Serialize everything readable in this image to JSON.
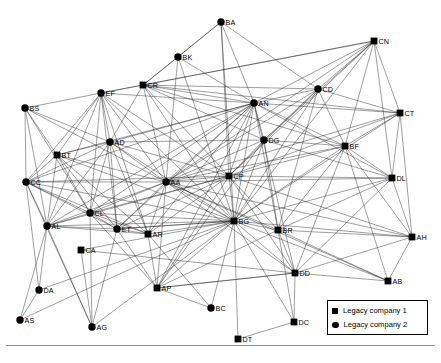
{
  "figure": {
    "type": "network-graph",
    "title": "",
    "background": "#ffffff",
    "edge_color": "#1a1a1a",
    "node_color": "#000000"
  },
  "legend": {
    "position": "bottom-right",
    "items": [
      {
        "marker": "square",
        "label": "Legacy company 1"
      },
      {
        "marker": "circle",
        "label": "Legacy company 2"
      }
    ]
  },
  "chart_data": {
    "type": "scatter",
    "title": "",
    "xlabel": "",
    "ylabel": "",
    "nodes": [
      {
        "id": "BA",
        "label": "BA",
        "x": 221,
        "y": 22,
        "shape": "circle"
      },
      {
        "id": "CN",
        "label": "CN",
        "x": 374,
        "y": 41,
        "shape": "square"
      },
      {
        "id": "BK",
        "label": "BK",
        "x": 178,
        "y": 57,
        "shape": "circle"
      },
      {
        "id": "CR",
        "label": "CR",
        "x": 143,
        "y": 85,
        "shape": "square"
      },
      {
        "id": "CD",
        "label": "CD",
        "x": 318,
        "y": 89,
        "shape": "circle"
      },
      {
        "id": "EF",
        "label": "EF",
        "x": 101,
        "y": 93,
        "shape": "circle"
      },
      {
        "id": "AN",
        "label": "AN",
        "x": 254,
        "y": 103,
        "shape": "circle"
      },
      {
        "id": "BS",
        "label": "BS",
        "x": 25,
        "y": 108,
        "shape": "circle"
      },
      {
        "id": "CT",
        "label": "CT",
        "x": 400,
        "y": 113,
        "shape": "square"
      },
      {
        "id": "DG",
        "label": "DG",
        "x": 264,
        "y": 140,
        "shape": "circle"
      },
      {
        "id": "AD",
        "label": "AD",
        "x": 110,
        "y": 142,
        "shape": "circle"
      },
      {
        "id": "BF",
        "label": "BF",
        "x": 345,
        "y": 146,
        "shape": "square"
      },
      {
        "id": "BT",
        "label": "BT",
        "x": 57,
        "y": 155,
        "shape": "square"
      },
      {
        "id": "DL",
        "label": "DL",
        "x": 392,
        "y": 178,
        "shape": "square"
      },
      {
        "id": "AA",
        "label": "AA",
        "x": 166,
        "y": 182,
        "shape": "circle"
      },
      {
        "id": "CP",
        "label": "CP",
        "x": 229,
        "y": 176,
        "shape": "square"
      },
      {
        "id": "CC",
        "label": "CC",
        "x": 26,
        "y": 182,
        "shape": "circle"
      },
      {
        "id": "CL",
        "label": "CL",
        "x": 90,
        "y": 213,
        "shape": "circle"
      },
      {
        "id": "BG",
        "label": "BG",
        "x": 234,
        "y": 221,
        "shape": "square"
      },
      {
        "id": "AL",
        "label": "AL",
        "x": 47,
        "y": 226,
        "shape": "circle"
      },
      {
        "id": "ET",
        "label": "ET",
        "x": 117,
        "y": 229,
        "shape": "circle"
      },
      {
        "id": "BR",
        "label": "BR",
        "x": 278,
        "y": 230,
        "shape": "square"
      },
      {
        "id": "AR",
        "label": "AR",
        "x": 148,
        "y": 234,
        "shape": "square"
      },
      {
        "id": "AH",
        "label": "AH",
        "x": 412,
        "y": 237,
        "shape": "square"
      },
      {
        "id": "CA",
        "label": "CA",
        "x": 81,
        "y": 250,
        "shape": "square"
      },
      {
        "id": "DD",
        "label": "DD",
        "x": 295,
        "y": 273,
        "shape": "square"
      },
      {
        "id": "DA",
        "label": "DA",
        "x": 39,
        "y": 290,
        "shape": "circle"
      },
      {
        "id": "AB",
        "label": "AB",
        "x": 388,
        "y": 281,
        "shape": "square"
      },
      {
        "id": "AP",
        "label": "AP",
        "x": 157,
        "y": 288,
        "shape": "square"
      },
      {
        "id": "BC",
        "label": "BC",
        "x": 211,
        "y": 308,
        "shape": "circle"
      },
      {
        "id": "AS",
        "label": "AS",
        "x": 20,
        "y": 320,
        "shape": "circle"
      },
      {
        "id": "DC",
        "label": "DC",
        "x": 294,
        "y": 322,
        "shape": "square"
      },
      {
        "id": "AG",
        "label": "AG",
        "x": 92,
        "y": 327,
        "shape": "circle"
      },
      {
        "id": "DT",
        "label": "DT",
        "x": 238,
        "y": 339,
        "shape": "square"
      }
    ],
    "edges": [
      [
        "BA",
        "CR"
      ],
      [
        "BA",
        "BK"
      ],
      [
        "BA",
        "AN"
      ],
      [
        "BA",
        "CP"
      ],
      [
        "BA",
        "BG"
      ],
      [
        "BA",
        "CD"
      ],
      [
        "CN",
        "AN"
      ],
      [
        "CN",
        "CD"
      ],
      [
        "CN",
        "CR"
      ],
      [
        "CN",
        "BF"
      ],
      [
        "CN",
        "CT"
      ],
      [
        "CN",
        "BG"
      ],
      [
        "CN",
        "DG"
      ],
      [
        "CN",
        "AA"
      ],
      [
        "CN",
        "DL"
      ],
      [
        "CN",
        "EF"
      ],
      [
        "CN",
        "CP"
      ],
      [
        "BK",
        "CR"
      ],
      [
        "BK",
        "AN"
      ],
      [
        "BK",
        "AA"
      ],
      [
        "BK",
        "BG"
      ],
      [
        "CR",
        "AN"
      ],
      [
        "CR",
        "AA"
      ],
      [
        "CR",
        "BG"
      ],
      [
        "CR",
        "CD"
      ],
      [
        "CR",
        "AD"
      ],
      [
        "CR",
        "CP"
      ],
      [
        "CR",
        "EF"
      ],
      [
        "CR",
        "DG"
      ],
      [
        "CR",
        "BF"
      ],
      [
        "CR",
        "CT"
      ],
      [
        "CD",
        "AN"
      ],
      [
        "CD",
        "DG"
      ],
      [
        "CD",
        "BG"
      ],
      [
        "CD",
        "BF"
      ],
      [
        "CD",
        "CP"
      ],
      [
        "CD",
        "AA"
      ],
      [
        "CD",
        "CT"
      ],
      [
        "CD",
        "BR"
      ],
      [
        "EF",
        "BS"
      ],
      [
        "EF",
        "AD"
      ],
      [
        "EF",
        "BT"
      ],
      [
        "EF",
        "CC"
      ],
      [
        "EF",
        "AA"
      ],
      [
        "EF",
        "AL"
      ],
      [
        "EF",
        "CL"
      ],
      [
        "EF",
        "ET"
      ],
      [
        "EF",
        "BG"
      ],
      [
        "EF",
        "AN"
      ],
      [
        "EF",
        "CP"
      ],
      [
        "EF",
        "AR"
      ],
      [
        "AN",
        "DG"
      ],
      [
        "AN",
        "AA"
      ],
      [
        "AN",
        "BG"
      ],
      [
        "AN",
        "CP"
      ],
      [
        "AN",
        "BF"
      ],
      [
        "AN",
        "AD"
      ],
      [
        "AN",
        "CC"
      ],
      [
        "AN",
        "BT"
      ],
      [
        "AN",
        "AL"
      ],
      [
        "AN",
        "CL"
      ],
      [
        "AN",
        "ET"
      ],
      [
        "AN",
        "AR"
      ],
      [
        "AN",
        "DL"
      ],
      [
        "AN",
        "CT"
      ],
      [
        "AN",
        "BR"
      ],
      [
        "AN",
        "AP"
      ],
      [
        "AN",
        "DD"
      ],
      [
        "BS",
        "CC"
      ],
      [
        "BS",
        "BT"
      ],
      [
        "BS",
        "AL"
      ],
      [
        "BS",
        "AD"
      ],
      [
        "BS",
        "AA"
      ],
      [
        "BS",
        "CL"
      ],
      [
        "CT",
        "BF"
      ],
      [
        "CT",
        "DL"
      ],
      [
        "CT",
        "BG"
      ],
      [
        "CT",
        "AA"
      ],
      [
        "CT",
        "AH"
      ],
      [
        "CT",
        "CP"
      ],
      [
        "DG",
        "BG"
      ],
      [
        "DG",
        "AA"
      ],
      [
        "DG",
        "CP"
      ],
      [
        "DG",
        "BF"
      ],
      [
        "DG",
        "BR"
      ],
      [
        "DG",
        "AP"
      ],
      [
        "DG",
        "DL"
      ],
      [
        "DG",
        "AD"
      ],
      [
        "AD",
        "AA"
      ],
      [
        "AD",
        "BT"
      ],
      [
        "AD",
        "CC"
      ],
      [
        "AD",
        "CL"
      ],
      [
        "AD",
        "AL"
      ],
      [
        "AD",
        "ET"
      ],
      [
        "AD",
        "BG"
      ],
      [
        "AD",
        "AR"
      ],
      [
        "AD",
        "CP"
      ],
      [
        "BF",
        "BG"
      ],
      [
        "BF",
        "DL"
      ],
      [
        "BF",
        "AA"
      ],
      [
        "BF",
        "CP"
      ],
      [
        "BF",
        "AH"
      ],
      [
        "BF",
        "BR"
      ],
      [
        "BF",
        "AB"
      ],
      [
        "BF",
        "DD"
      ],
      [
        "BT",
        "CC"
      ],
      [
        "BT",
        "AL"
      ],
      [
        "BT",
        "AA"
      ],
      [
        "BT",
        "CL"
      ],
      [
        "BT",
        "ET"
      ],
      [
        "BT",
        "BG"
      ],
      [
        "BT",
        "AR"
      ],
      [
        "DL",
        "BG"
      ],
      [
        "DL",
        "AH"
      ],
      [
        "DL",
        "AA"
      ],
      [
        "DL",
        "DD"
      ],
      [
        "DL",
        "BR"
      ],
      [
        "DL",
        "CP"
      ],
      [
        "AA",
        "BG"
      ],
      [
        "AA",
        "CP"
      ],
      [
        "AA",
        "CL"
      ],
      [
        "AA",
        "ET"
      ],
      [
        "AA",
        "AL"
      ],
      [
        "AA",
        "CC"
      ],
      [
        "AA",
        "AR"
      ],
      [
        "AA",
        "BR"
      ],
      [
        "AA",
        "AP"
      ],
      [
        "AA",
        "DD"
      ],
      [
        "AA",
        "AH"
      ],
      [
        "AA",
        "AB"
      ],
      [
        "CP",
        "BG"
      ],
      [
        "CP",
        "BR"
      ],
      [
        "CP",
        "AR"
      ],
      [
        "CP",
        "ET"
      ],
      [
        "CP",
        "AP"
      ],
      [
        "CP",
        "DD"
      ],
      [
        "CP",
        "AH"
      ],
      [
        "CP",
        "CL"
      ],
      [
        "CP",
        "AL"
      ],
      [
        "CP",
        "CC"
      ],
      [
        "CC",
        "AL"
      ],
      [
        "CC",
        "CL"
      ],
      [
        "CC",
        "ET"
      ],
      [
        "CC",
        "BG"
      ],
      [
        "CC",
        "AR"
      ],
      [
        "CC",
        "AG"
      ],
      [
        "CC",
        "DA"
      ],
      [
        "CL",
        "ET"
      ],
      [
        "CL",
        "AL"
      ],
      [
        "CL",
        "BG"
      ],
      [
        "CL",
        "AR"
      ],
      [
        "CL",
        "AG"
      ],
      [
        "CL",
        "AP"
      ],
      [
        "BG",
        "BR"
      ],
      [
        "BG",
        "AR"
      ],
      [
        "BG",
        "ET"
      ],
      [
        "BG",
        "AL"
      ],
      [
        "BG",
        "AP"
      ],
      [
        "BG",
        "DD"
      ],
      [
        "BG",
        "DC"
      ],
      [
        "BG",
        "DT"
      ],
      [
        "BG",
        "BC"
      ],
      [
        "BG",
        "AH"
      ],
      [
        "BG",
        "AB"
      ],
      [
        "BG",
        "AG"
      ],
      [
        "BG",
        "DA"
      ],
      [
        "BG",
        "CA"
      ],
      [
        "BG",
        "AS"
      ],
      [
        "AL",
        "ET"
      ],
      [
        "AL",
        "AR"
      ],
      [
        "AL",
        "DA"
      ],
      [
        "AL",
        "AG"
      ],
      [
        "AL",
        "AS"
      ],
      [
        "ET",
        "AR"
      ],
      [
        "ET",
        "AP"
      ],
      [
        "ET",
        "BG"
      ],
      [
        "ET",
        "AG"
      ],
      [
        "BR",
        "DD"
      ],
      [
        "BR",
        "AH"
      ],
      [
        "BR",
        "AB"
      ],
      [
        "BR",
        "DC"
      ],
      [
        "BR",
        "AP"
      ],
      [
        "AR",
        "AP"
      ],
      [
        "AR",
        "BC"
      ],
      [
        "AH",
        "AB"
      ],
      [
        "AH",
        "DD"
      ],
      [
        "DD",
        "AB"
      ],
      [
        "DD",
        "DC"
      ],
      [
        "DD",
        "AP"
      ],
      [
        "DA",
        "AS"
      ],
      [
        "AP",
        "BC"
      ],
      [
        "AP",
        "DD"
      ],
      [
        "DC",
        "DT"
      ],
      [
        "CA",
        "AG"
      ],
      [
        "CA",
        "DD"
      ]
    ]
  }
}
